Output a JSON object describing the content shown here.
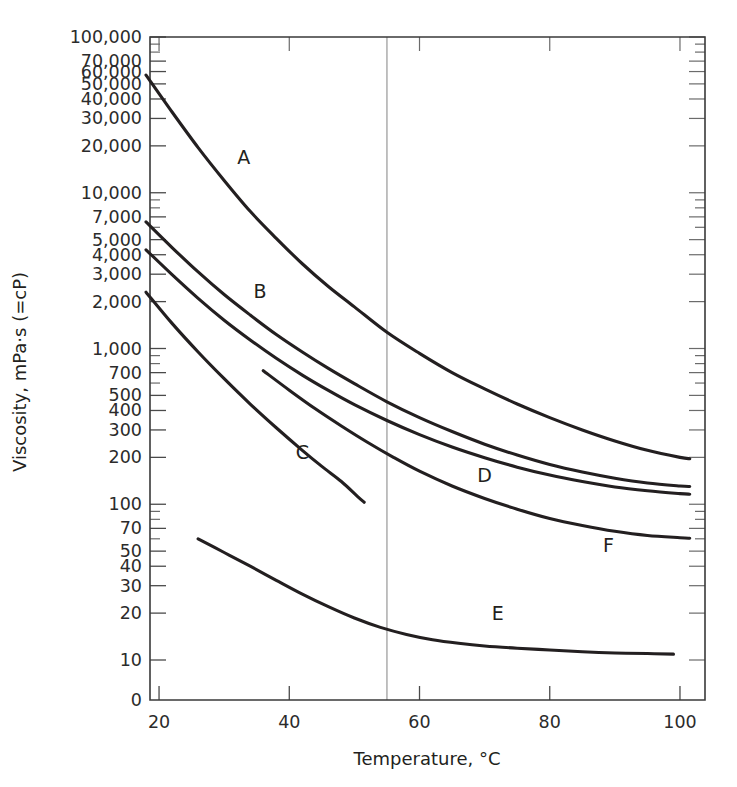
{
  "chart_data": {
    "type": "line",
    "title": "",
    "xlabel": "Temperature, °C",
    "ylabel": "Viscosity, mPa·s (=cP)",
    "yscale": "log",
    "xscale": "linear",
    "xlim": [
      16,
      102
    ],
    "ylim": [
      8,
      110000
    ],
    "grid": false,
    "legend_position": "inline-curve-labels",
    "x_ticks": [
      20,
      40,
      60,
      80,
      100
    ],
    "x_tick_labels": [
      "20",
      "40",
      "60",
      "80",
      "100"
    ],
    "x_minor_ticks": [],
    "y_tick_labels": [
      {
        "value": 100000,
        "label": "100,000"
      },
      {
        "value": 70000,
        "label": "70,000"
      },
      {
        "value": 60000,
        "label": "60,000"
      },
      {
        "value": 50000,
        "label": "50,000"
      },
      {
        "value": 40000,
        "label": "40,000"
      },
      {
        "value": 30000,
        "label": "30,000"
      },
      {
        "value": 20000,
        "label": "20,000"
      },
      {
        "value": 10000,
        "label": "10,000"
      },
      {
        "value": 7000,
        "label": "7,000"
      },
      {
        "value": 5000,
        "label": "5,000"
      },
      {
        "value": 4000,
        "label": "4,000"
      },
      {
        "value": 3000,
        "label": "3,000"
      },
      {
        "value": 2000,
        "label": "2,000"
      },
      {
        "value": 1000,
        "label": "1,000"
      },
      {
        "value": 700,
        "label": "700"
      },
      {
        "value": 500,
        "label": "500"
      },
      {
        "value": 400,
        "label": "400"
      },
      {
        "value": 300,
        "label": "300"
      },
      {
        "value": 200,
        "label": "200"
      },
      {
        "value": 100,
        "label": "100"
      },
      {
        "value": 70,
        "label": "70"
      },
      {
        "value": 50,
        "label": "50"
      },
      {
        "value": 40,
        "label": "40"
      },
      {
        "value": 30,
        "label": "30"
      },
      {
        "value": 20,
        "label": "20"
      },
      {
        "value": 10,
        "label": "10"
      }
    ],
    "y_axis_origin_label": "0",
    "y_unlabeled_ticks": [
      90000,
      80000,
      9000,
      8000,
      6000,
      900,
      800,
      600,
      90,
      80,
      60
    ],
    "reference_lines": [
      {
        "axis": "x",
        "value": 55,
        "label": ""
      }
    ],
    "series": [
      {
        "name": "A",
        "label": "A",
        "label_at": {
          "x": 33,
          "y": 17000
        },
        "points": [
          [
            18,
            57000
          ],
          [
            22,
            33000
          ],
          [
            26,
            19500
          ],
          [
            30,
            12000
          ],
          [
            34,
            7600
          ],
          [
            38,
            5100
          ],
          [
            42,
            3500
          ],
          [
            46,
            2500
          ],
          [
            50,
            1850
          ],
          [
            55,
            1270
          ],
          [
            60,
            930
          ],
          [
            65,
            700
          ],
          [
            70,
            550
          ],
          [
            75,
            440
          ],
          [
            80,
            360
          ],
          [
            85,
            300
          ],
          [
            90,
            255
          ],
          [
            95,
            222
          ],
          [
            100,
            200
          ],
          [
            101.5,
            196
          ]
        ]
      },
      {
        "name": "B",
        "label": "B",
        "label_at": {
          "x": 35.5,
          "y": 2350
        },
        "points": [
          [
            18,
            6500
          ],
          [
            22,
            4450
          ],
          [
            26,
            3100
          ],
          [
            30,
            2220
          ],
          [
            34,
            1640
          ],
          [
            38,
            1230
          ],
          [
            42,
            950
          ],
          [
            46,
            745
          ],
          [
            50,
            595
          ],
          [
            55,
            455
          ],
          [
            60,
            360
          ],
          [
            65,
            293
          ],
          [
            70,
            243
          ],
          [
            75,
            207
          ],
          [
            80,
            180
          ],
          [
            85,
            161
          ],
          [
            90,
            147
          ],
          [
            95,
            137
          ],
          [
            100,
            131
          ],
          [
            101.5,
            130
          ]
        ]
      },
      {
        "name": "C",
        "label": "C",
        "label_at": {
          "x": 42,
          "y": 215
        },
        "points": [
          [
            18,
            2300
          ],
          [
            22,
            1450
          ],
          [
            26,
            950
          ],
          [
            30,
            640
          ],
          [
            34,
            440
          ],
          [
            38,
            310
          ],
          [
            42,
            222
          ],
          [
            45,
            175
          ],
          [
            48,
            140
          ],
          [
            50.5,
            112
          ],
          [
            51.5,
            103
          ]
        ]
      },
      {
        "name": "D",
        "label": "D",
        "label_at": {
          "x": 70,
          "y": 155
        },
        "points": [
          [
            18,
            4300
          ],
          [
            22,
            2980
          ],
          [
            26,
            2100
          ],
          [
            30,
            1520
          ],
          [
            34,
            1135
          ],
          [
            38,
            865
          ],
          [
            42,
            675
          ],
          [
            46,
            538
          ],
          [
            50,
            436
          ],
          [
            55,
            345
          ],
          [
            60,
            280
          ],
          [
            65,
            233
          ],
          [
            70,
            199
          ],
          [
            75,
            173
          ],
          [
            80,
            154
          ],
          [
            85,
            140
          ],
          [
            90,
            129
          ],
          [
            95,
            122
          ],
          [
            100,
            117
          ],
          [
            101.5,
            116
          ]
        ]
      },
      {
        "name": "E",
        "label": "E",
        "label_at": {
          "x": 72,
          "y": 20
        },
        "points": [
          [
            26,
            60
          ],
          [
            30,
            49
          ],
          [
            34,
            40
          ],
          [
            38,
            32.5
          ],
          [
            42,
            26.5
          ],
          [
            46,
            22
          ],
          [
            50,
            18.6
          ],
          [
            54,
            16.2
          ],
          [
            58,
            14.6
          ],
          [
            62,
            13.5
          ],
          [
            66,
            12.8
          ],
          [
            70,
            12.3
          ],
          [
            75,
            11.9
          ],
          [
            80,
            11.6
          ],
          [
            85,
            11.3
          ],
          [
            90,
            11.1
          ],
          [
            95,
            11.0
          ],
          [
            99,
            10.9
          ]
        ]
      },
      {
        "name": "F",
        "label": "F",
        "label_at": {
          "x": 89,
          "y": 55
        },
        "points": [
          [
            36,
            720
          ],
          [
            40,
            540
          ],
          [
            44,
            410
          ],
          [
            48,
            318
          ],
          [
            52,
            250
          ],
          [
            56,
            200
          ],
          [
            60,
            163
          ],
          [
            65,
            131
          ],
          [
            70,
            109
          ],
          [
            75,
            93
          ],
          [
            80,
            81
          ],
          [
            85,
            73
          ],
          [
            90,
            67
          ],
          [
            95,
            63
          ],
          [
            100,
            61
          ],
          [
            101.5,
            60.5
          ]
        ]
      }
    ]
  },
  "colors": {
    "curve": "#231f20",
    "axis": "#3a3a3a",
    "tick": "#6b6b6b",
    "reference_line": "#8d8d8d",
    "background": "#ffffff"
  }
}
